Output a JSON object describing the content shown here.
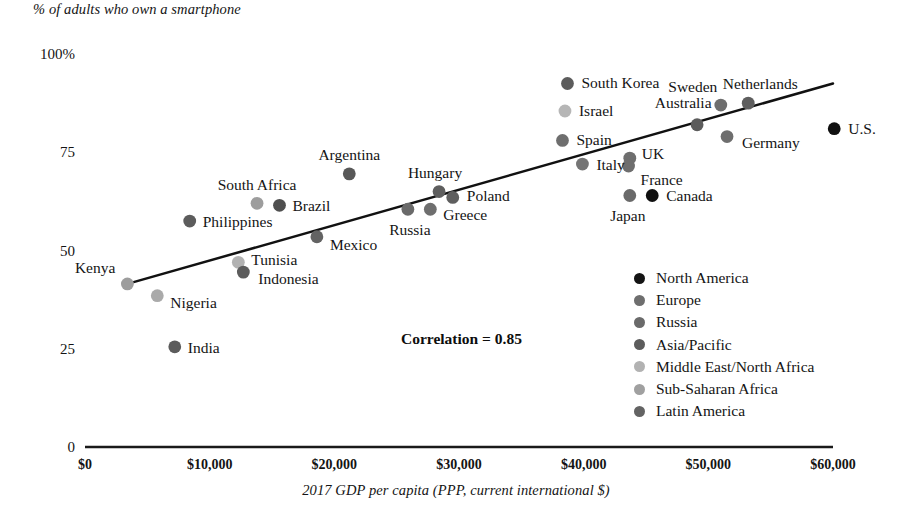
{
  "chart_data": {
    "type": "scatter",
    "title": "% of adults who own a smartphone",
    "xlabel": "2017 GDP per capita (PPP, current international $)",
    "ylabel": "% of adults who own a smartphone",
    "xlim": [
      0,
      60000
    ],
    "ylim": [
      0,
      100
    ],
    "grid": false,
    "legend_position": "inside-lower-right",
    "annotation": "Correlation = 0.85",
    "correlation": 0.85,
    "xticks": [
      "$0",
      "$10,000",
      "$20,000",
      "$30,000",
      "$40,000",
      "$50,000",
      "$60,000"
    ],
    "xtick_values": [
      0,
      10000,
      20000,
      30000,
      40000,
      50000,
      60000
    ],
    "yticks": [
      "0",
      "25",
      "50",
      "75",
      "100%"
    ],
    "ytick_values": [
      0,
      25,
      50,
      75,
      100
    ],
    "trendline": {
      "x0": 3400,
      "y0": 41.5,
      "x1": 60000,
      "y1": 92.5
    },
    "legend": [
      {
        "label": "North America",
        "color": "#141414"
      },
      {
        "label": "Europe",
        "color": "#6e6e6e"
      },
      {
        "label": "Russia",
        "color": "#6a6a6a"
      },
      {
        "label": "Asia/Pacific",
        "color": "#5c5c5c"
      },
      {
        "label": "Middle East/North Africa",
        "color": "#b2b2b2"
      },
      {
        "label": "Sub-Saharan Africa",
        "color": "#a0a0a0"
      },
      {
        "label": "Latin America",
        "color": "#636363"
      }
    ],
    "points": [
      {
        "name": "Kenya",
        "x": 3400,
        "y": 41.5,
        "group": "Sub-Saharan Africa",
        "color": "#9d9d9d",
        "label_pos": "left",
        "label_dx": -12,
        "label_dy": -16
      },
      {
        "name": "Nigeria",
        "x": 5800,
        "y": 38.5,
        "group": "Sub-Saharan Africa",
        "color": "#aaaaaa",
        "label_pos": "right",
        "label_dx": 13,
        "label_dy": 7
      },
      {
        "name": "India",
        "x": 7200,
        "y": 25.5,
        "group": "Asia/Pacific",
        "color": "#5c5c5c",
        "label_pos": "right",
        "label_dx": 13,
        "label_dy": 1
      },
      {
        "name": "Philippines",
        "x": 8400,
        "y": 57.5,
        "group": "Asia/Pacific",
        "color": "#5c5c5c",
        "label_pos": "right",
        "label_dx": 13,
        "label_dy": 1
      },
      {
        "name": "South Africa",
        "x": 13800,
        "y": 62.0,
        "group": "Sub-Saharan Africa",
        "color": "#9d9d9d",
        "label_pos": "center",
        "label_dx": 0,
        "label_dy": -18
      },
      {
        "name": "Tunisia",
        "x": 12300,
        "y": 47.0,
        "group": "Middle East/North Africa",
        "color": "#b2b2b2",
        "label_pos": "right",
        "label_dx": 13,
        "label_dy": -2
      },
      {
        "name": "Indonesia",
        "x": 12700,
        "y": 44.5,
        "group": "Asia/Pacific",
        "color": "#5c5c5c",
        "label_pos": "right",
        "label_dx": 15,
        "label_dy": 7
      },
      {
        "name": "Brazil",
        "x": 15600,
        "y": 61.5,
        "group": "Latin America",
        "color": "#4f4f4f",
        "label_pos": "right",
        "label_dx": 13,
        "label_dy": 1
      },
      {
        "name": "Mexico",
        "x": 18600,
        "y": 53.5,
        "group": "Latin America",
        "color": "#636363",
        "label_pos": "right",
        "label_dx": 13,
        "label_dy": 8
      },
      {
        "name": "Argentina",
        "x": 21200,
        "y": 69.5,
        "group": "Latin America",
        "color": "#585858",
        "label_pos": "center",
        "label_dx": 0,
        "label_dy": -19
      },
      {
        "name": "Russia",
        "x": 25900,
        "y": 60.5,
        "group": "Russia",
        "color": "#6a6a6a",
        "label_pos": "center",
        "label_dx": 2,
        "label_dy": 21
      },
      {
        "name": "Greece",
        "x": 27700,
        "y": 60.5,
        "group": "Europe",
        "color": "#6e6e6e",
        "label_pos": "right",
        "label_dx": 13,
        "label_dy": 6
      },
      {
        "name": "Hungary",
        "x": 28400,
        "y": 65.0,
        "group": "Europe",
        "color": "#5e5e5e",
        "label_pos": "center",
        "label_dx": -4,
        "label_dy": -19
      },
      {
        "name": "Poland",
        "x": 29500,
        "y": 63.5,
        "group": "Europe",
        "color": "#5e5e5e",
        "label_pos": "right",
        "label_dx": 14,
        "label_dy": -1
      },
      {
        "name": "South Korea",
        "x": 38700,
        "y": 92.5,
        "group": "Asia/Pacific",
        "color": "#5c5c5c",
        "label_pos": "right",
        "label_dx": 14,
        "label_dy": 0
      },
      {
        "name": "Israel",
        "x": 38500,
        "y": 85.5,
        "group": "Middle East/North Africa",
        "color": "#b6b6b6",
        "label_pos": "right",
        "label_dx": 14,
        "label_dy": 0
      },
      {
        "name": "Spain",
        "x": 38300,
        "y": 78.0,
        "group": "Europe",
        "color": "#6e6e6e",
        "label_pos": "right",
        "label_dx": 14,
        "label_dy": 0
      },
      {
        "name": "Italy",
        "x": 39900,
        "y": 72.0,
        "group": "Europe",
        "color": "#757575",
        "label_pos": "right",
        "label_dx": 14,
        "label_dy": 1
      },
      {
        "name": "UK",
        "x": 43700,
        "y": 73.5,
        "group": "Europe",
        "color": "#6e6e6e",
        "label_pos": "right",
        "label_dx": 12,
        "label_dy": -4
      },
      {
        "name": "France",
        "x": 43600,
        "y": 71.5,
        "group": "Europe",
        "color": "#6e6e6e",
        "label_pos": "right",
        "label_dx": 12,
        "label_dy": 14
      },
      {
        "name": "Japan",
        "x": 43700,
        "y": 64.0,
        "group": "Asia/Pacific",
        "color": "#6a6a6a",
        "label_pos": "center",
        "label_dx": -2,
        "label_dy": 21
      },
      {
        "name": "Canada",
        "x": 45500,
        "y": 64.0,
        "group": "North America",
        "color": "#101010",
        "label_pos": "right",
        "label_dx": 14,
        "label_dy": 1
      },
      {
        "name": "Australia",
        "x": 49100,
        "y": 82.0,
        "group": "Asia/Pacific",
        "color": "#5c5c5c",
        "label_pos": "center",
        "label_dx": -14,
        "label_dy": -22
      },
      {
        "name": "Sweden",
        "x": 51000,
        "y": 87.0,
        "group": "Europe",
        "color": "#6e6e6e",
        "label_pos": "center",
        "label_dx": -28,
        "label_dy": -18
      },
      {
        "name": "Germany",
        "x": 51500,
        "y": 79.0,
        "group": "Europe",
        "color": "#6e6e6e",
        "label_pos": "right",
        "label_dx": 15,
        "label_dy": 6
      },
      {
        "name": "Netherlands",
        "x": 53200,
        "y": 87.5,
        "group": "Europe",
        "color": "#5e5e5e",
        "label_pos": "center",
        "label_dx": 12,
        "label_dy": -19
      },
      {
        "name": "U.S.",
        "x": 60100,
        "y": 81.0,
        "group": "North America",
        "color": "#101010",
        "label_pos": "right",
        "label_dx": 14,
        "label_dy": 0
      }
    ]
  }
}
